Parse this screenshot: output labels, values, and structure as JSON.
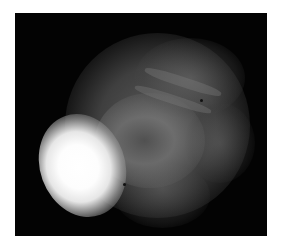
{
  "image": {
    "description": "Grayscale fluorescence-style microscopy image of a rounded cell cluster on a black background with a bright white spot at lower left",
    "background_color": "#030303",
    "border_color": "#ffffff",
    "highlight_color": "#ffffff"
  }
}
